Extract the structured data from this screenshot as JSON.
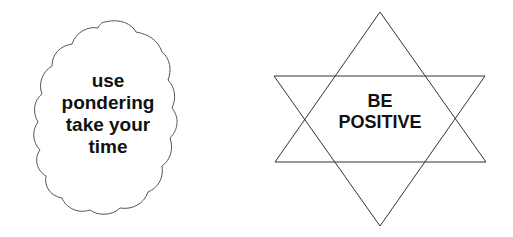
{
  "cloud": {
    "lines": [
      "use",
      "pondering",
      "take your",
      "time"
    ],
    "stroke": "#555555"
  },
  "star": {
    "lines": [
      "BE",
      "POSITIVE"
    ],
    "stroke": "#333333"
  }
}
